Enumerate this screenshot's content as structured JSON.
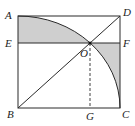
{
  "diagram": {
    "type": "geometry",
    "colors": {
      "line": "#2a2a2a",
      "shade": "#cfcfcf",
      "background": "#ffffff"
    },
    "points": {
      "A": {
        "label": "A",
        "x": 18,
        "y": 16
      },
      "D": {
        "label": "D",
        "x": 120,
        "y": 16
      },
      "B": {
        "label": "B",
        "x": 18,
        "y": 108
      },
      "C": {
        "label": "C",
        "x": 120,
        "y": 108
      },
      "E": {
        "label": "E",
        "x": 18,
        "y": 43
      },
      "F": {
        "label": "F",
        "x": 120,
        "y": 43
      },
      "O": {
        "label": "O",
        "x": 90,
        "y": 43
      },
      "G": {
        "label": "G",
        "x": 90,
        "y": 108
      }
    },
    "segments": [
      "AD",
      "DC",
      "CB",
      "BA",
      "BD",
      "EF",
      "OG (dashed)"
    ],
    "arc": {
      "center": "B",
      "from": "A",
      "to": "C"
    },
    "shaded_regions": [
      "region between AD, AE, EO and arc AO",
      "region between OF, FC and arc OC"
    ]
  }
}
